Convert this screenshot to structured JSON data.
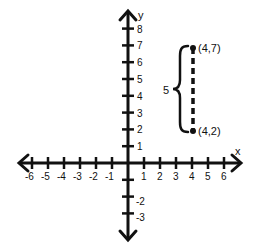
{
  "chart_data": {
    "type": "scatter",
    "title": "",
    "xlabel": "x",
    "ylabel": "y",
    "xlim": [
      -6,
      6
    ],
    "ylim": [
      -3,
      8
    ],
    "grid": false,
    "x_ticks": [
      -6,
      -5,
      -4,
      -3,
      -2,
      -1,
      1,
      2,
      3,
      4,
      5,
      6
    ],
    "x_tick_labels": [
      "-6",
      "-5",
      "-4",
      "-3",
      "-2",
      "-1",
      "1",
      "2",
      "3",
      "4",
      "5",
      "6"
    ],
    "y_ticks": [
      -3,
      -2,
      -1,
      1,
      2,
      3,
      4,
      5,
      6,
      7,
      8
    ],
    "y_tick_labels": [
      "-3",
      "-2",
      "",
      "1",
      "2",
      "3",
      "4",
      "5",
      "6",
      "7",
      "8"
    ],
    "series": [
      {
        "name": "vertical segment",
        "points": [
          {
            "x": 4,
            "y": 7,
            "label": "(4,7)"
          },
          {
            "x": 4,
            "y": 2,
            "label": "(4,2)"
          }
        ],
        "line_style": "dashed"
      }
    ],
    "annotations": [
      {
        "type": "brace",
        "text": "5",
        "from": [
          4,
          2
        ],
        "to": [
          4,
          7
        ],
        "side": "left",
        "meaning": "vertical distance"
      }
    ]
  },
  "labels": {
    "x_axis": "x",
    "y_axis": "y",
    "point_top": "(4,7)",
    "point_bottom": "(4,2)",
    "distance": "5"
  },
  "colors": {
    "ink": "#111111",
    "background": "#ffffff"
  }
}
